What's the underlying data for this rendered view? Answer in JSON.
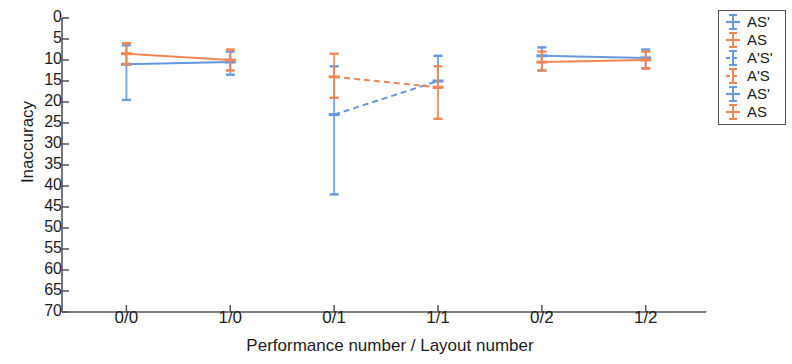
{
  "chart_data": {
    "type": "line",
    "title": "",
    "xlabel": "Performance number / Layout number",
    "ylabel": "Inaccuracy",
    "categories": [
      "0/0",
      "1/0",
      "0/1",
      "1/1",
      "0/2",
      "1/2"
    ],
    "ylim": [
      0,
      70
    ],
    "y_inverted": true,
    "yticks": [
      0,
      5,
      10,
      15,
      20,
      25,
      30,
      35,
      40,
      45,
      50,
      55,
      60,
      65,
      70
    ],
    "grid": false,
    "legend_position": "right-outside",
    "colors": {
      "blue": "#6699dd",
      "orange": "#ee8855",
      "axis": "#555555",
      "text": "#1d1d1d"
    },
    "series": [
      {
        "name": "AS'",
        "color": "#6699dd",
        "linestyle": "solid",
        "points": [
          {
            "x": "0/0",
            "y": 11.0,
            "err_low": 6.5,
            "err_high": 19.5
          },
          {
            "x": "1/0",
            "y": 10.5,
            "err_low": 8.0,
            "err_high": 13.5
          }
        ]
      },
      {
        "name": "AS",
        "color": "#ee8855",
        "linestyle": "solid",
        "points": [
          {
            "x": "0/0",
            "y": 8.5,
            "err_low": 6.0,
            "err_high": 11.0
          },
          {
            "x": "1/0",
            "y": 10.0,
            "err_low": 7.5,
            "err_high": 12.5
          }
        ]
      },
      {
        "name": "A'S'",
        "color": "#6699dd",
        "linestyle": "dashed",
        "points": [
          {
            "x": "0/1",
            "y": 23.0,
            "err_low": 11.5,
            "err_high": 42.0
          },
          {
            "x": "1/1",
            "y": 15.0,
            "err_low": 9.0,
            "err_high": 16.5
          }
        ]
      },
      {
        "name": "A'S",
        "color": "#ee8855",
        "linestyle": "dashed",
        "points": [
          {
            "x": "0/1",
            "y": 14.0,
            "err_low": 8.5,
            "err_high": 19.0
          },
          {
            "x": "1/1",
            "y": 16.5,
            "err_low": 11.5,
            "err_high": 24.0
          }
        ]
      },
      {
        "name": "AS'",
        "color": "#6699dd",
        "linestyle": "solid",
        "points": [
          {
            "x": "0/2",
            "y": 9.0,
            "err_low": 7.0,
            "err_high": 12.5
          },
          {
            "x": "1/2",
            "y": 9.5,
            "err_low": 7.5,
            "err_high": 12.0
          }
        ]
      },
      {
        "name": "AS",
        "color": "#ee8855",
        "linestyle": "solid",
        "points": [
          {
            "x": "0/2",
            "y": 10.5,
            "err_low": 8.0,
            "err_high": 12.5
          },
          {
            "x": "1/2",
            "y": 10.0,
            "err_low": 8.0,
            "err_high": 12.0
          }
        ]
      }
    ]
  },
  "legend": {
    "items": [
      {
        "label": "AS'",
        "color": "#6699dd",
        "linestyle": "solid"
      },
      {
        "label": "AS",
        "color": "#ee8855",
        "linestyle": "solid"
      },
      {
        "label": "A'S'",
        "color": "#6699dd",
        "linestyle": "dashed"
      },
      {
        "label": "A'S",
        "color": "#ee8855",
        "linestyle": "dashed"
      },
      {
        "label": "AS'",
        "color": "#6699dd",
        "linestyle": "solid"
      },
      {
        "label": "AS",
        "color": "#ee8855",
        "linestyle": "solid"
      }
    ]
  }
}
